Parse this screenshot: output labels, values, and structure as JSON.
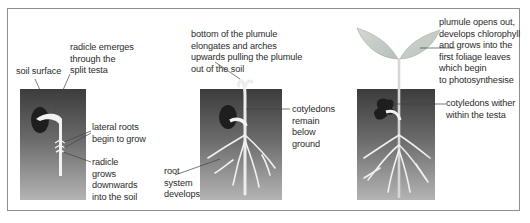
{
  "diagram": {
    "type": "seed germination stages (hypogeal)",
    "colors": {
      "frame_border": "#8e8e8e",
      "soil_top": "#3c3c3c",
      "soil_bottom": "#b4b4b4",
      "seed": "#1e1e1e",
      "root": "#f2f2f2",
      "leaf": "#c4ccc4",
      "label_text": "#2b2b2b"
    },
    "stages": [
      {
        "id": "stage-1",
        "labels": {
          "soil_surface": "soil surface",
          "radicle_emerges": "radicle emerges\nthrough the\nsplit testa",
          "lateral_roots": "lateral roots\nbegin to grow",
          "radicle_grows": "radicle\ngrows\ndownwards\ninto the soil"
        }
      },
      {
        "id": "stage-2",
        "labels": {
          "plumule_arches": "bottom of the plumule\nelongates and arches\nupwards pulling the plumule\nout of the soil",
          "cotyledons_remain": "cotyledons\nremain\nbelow\nground",
          "root_system": "root\nsystem\ndevelops"
        }
      },
      {
        "id": "stage-3",
        "labels": {
          "plumule_opens": "plumule opens out,\ndevelops chlorophyll\nand grows into the\nfirst foliage leaves\nwhich begin\nto photosynthesise",
          "cotyledons_wither": "cotyledons wither\nwithin the testa"
        }
      }
    ]
  }
}
